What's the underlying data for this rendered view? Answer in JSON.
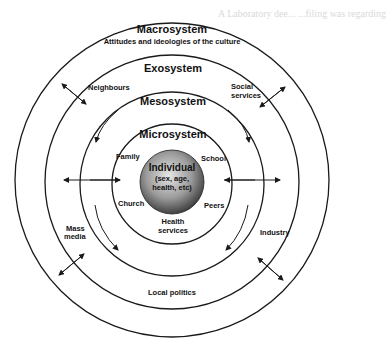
{
  "background_text": [
    "A Laboratory dee... ...filing was regarding",
    "..."
  ],
  "diagram": {
    "center": {
      "label": "Individual",
      "sub": "(sex, age, health, etc)"
    },
    "rings": [
      {
        "name": "Microsystem",
        "items": [
          "Family",
          "School",
          "Church",
          "Peers",
          "Health services"
        ]
      },
      {
        "name": "Mesosystem",
        "items": []
      },
      {
        "name": "Exosystem",
        "items": [
          "Neighbours",
          "Social services",
          "Mass media",
          "Industry",
          "Local politics"
        ]
      },
      {
        "name": "Macrosystem",
        "subtitle": "Attitudes and ideologies of the culture",
        "items": []
      }
    ],
    "labels": {
      "macro": "Macrosystem",
      "macro_sub": "Attitudes and ideologies of the culture",
      "exo": "Exosystem",
      "meso": "Mesosystem",
      "micro": "Microsystem",
      "individual": "Individual",
      "individual_sub1": "(sex, age,",
      "individual_sub2": "health, etc)",
      "family": "Family",
      "school": "School",
      "church": "Church",
      "peers": "Peers",
      "health1": "Health",
      "health2": "services",
      "neighbours": "Neighbours",
      "social1": "Social",
      "social2": "services",
      "mass1": "Mass",
      "mass2": "media",
      "industry": "Industry",
      "local_politics": "Local politics"
    },
    "colors": {
      "line": "#1a1a1a",
      "sphere_light": "#d8d8d8",
      "sphere_dark": "#3a3a3a"
    }
  }
}
